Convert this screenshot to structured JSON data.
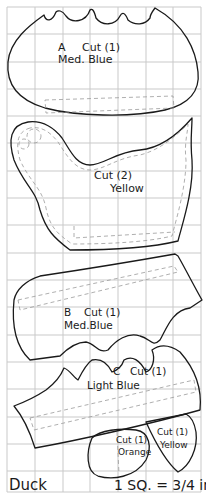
{
  "title": "Duck",
  "scale_note": "1 SQ. = 3/4 in.",
  "scale_parts": {
    "prefix": "1",
    "unit": "SQ.=",
    "fraction": "3/4",
    "suffix": "in."
  },
  "grid": {
    "columns": 7,
    "rows": 18,
    "cell_size_px": 27.5,
    "line_color": "#c9c9c9"
  },
  "pieces": [
    {
      "id": "A",
      "letter": "A",
      "cut": "Cut (1)",
      "color": "Med. Blue",
      "part": "body"
    },
    {
      "id": "wing",
      "letter": "",
      "cut": "Cut (2)",
      "color": "Yellow",
      "part": "wing"
    },
    {
      "id": "B",
      "letter": "B",
      "cut": "Cut (1)",
      "color": "Med.Blue",
      "part": "water band"
    },
    {
      "id": "C",
      "letter": "C",
      "cut": "Cut (1)",
      "color": "Light Blue",
      "part": "waves"
    },
    {
      "id": "beak",
      "letter": "",
      "cut": "Cut (1)",
      "color": "Orange",
      "part": "beak"
    },
    {
      "id": "head",
      "letter": "",
      "cut": "Cut (1)",
      "color": "Yellow",
      "part": "tuft"
    }
  ],
  "colors": {
    "outline": "#1a1a1a",
    "seam": "#9a9a9a",
    "paper": "#ffffff"
  }
}
